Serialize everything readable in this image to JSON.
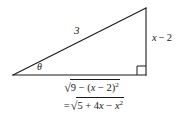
{
  "figure": {
    "name": "right-triangle-trig-substitution-diagram",
    "shape": "right triangle",
    "stroke_color": "#1a1a1a",
    "background_color": "#ffffff",
    "labels": {
      "hypotenuse": "3",
      "vertical_leg": "x − 2",
      "vertical_leg_variable": "x",
      "vertical_leg_operator": "−",
      "vertical_leg_constant": "2",
      "angle": "θ",
      "right_angle_marker": "right-angle"
    },
    "base_expression": {
      "line1": {
        "radical_sign": "√",
        "radicand_prefix": "9 − (",
        "radicand_variable": "x",
        "radicand_middle": " − 2)",
        "radicand_exponent": "2",
        "plain": "√(9 − (x − 2)²)"
      },
      "line2": {
        "equals": "=",
        "radical_sign": "√",
        "radicand_prefix": "5 + 4",
        "radicand_variable_1": "x",
        "radicand_middle": " − ",
        "radicand_variable_2": "x",
        "radicand_exponent": "2",
        "plain": "= √(5 + 4x − x²)"
      }
    },
    "geometry": {
      "left_vertex": [
        13,
        75
      ],
      "right_angle_vertex": [
        146,
        75
      ],
      "apex": [
        146,
        8
      ]
    }
  }
}
